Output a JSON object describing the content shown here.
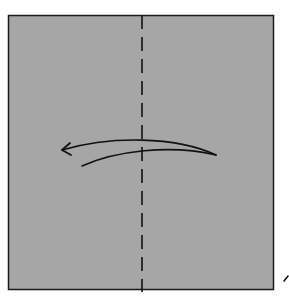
{
  "diagram": {
    "type": "origami-fold-step",
    "paper": {
      "shape": "square",
      "fill": "#a6a6a6",
      "stroke": "#1a1a1a",
      "x": 8,
      "y": 15,
      "width": 266,
      "height": 275
    },
    "fold_line": {
      "kind": "valley-fold",
      "style": "dashed",
      "orientation": "vertical",
      "x": 142,
      "y1": 15,
      "y2": 292,
      "dash": "14 8",
      "color": "#111111"
    },
    "arrow": {
      "meaning": "fold right half over to the left",
      "direction": "left",
      "color": "#111111",
      "head": [
        62,
        150
      ],
      "tail_tip": [
        216,
        155
      ]
    },
    "corner_mark": {
      "meaning": "partial next-step mark",
      "x": 285,
      "y": 278,
      "color": "#111111"
    },
    "colors": {
      "background": "#ffffff",
      "paper": "#a6a6a6",
      "ink": "#111111"
    }
  }
}
